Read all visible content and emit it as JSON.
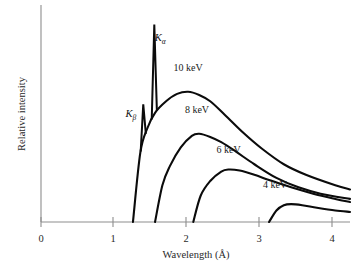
{
  "chart_data": {
    "type": "line",
    "title": "",
    "xlabel": "Wavelength (Å)",
    "ylabel": "Relative intensity",
    "xlim": [
      0,
      4.2
    ],
    "ylim": [
      0,
      1.0
    ],
    "grid": false,
    "legend": "inline-labels",
    "x_ticks": [
      "0",
      "1",
      "2",
      "3",
      "4"
    ],
    "x_tick_values": [
      0,
      1,
      2,
      3,
      4
    ],
    "y_ticks": [],
    "annotations": [
      {
        "text": "Kα",
        "base": "K",
        "sub": "α",
        "x": 1.62,
        "y": 0.86,
        "note": "characteristic K-alpha emission line"
      },
      {
        "text": "Kβ",
        "base": "K",
        "sub": "β",
        "x": 1.22,
        "y": 0.5,
        "note": "characteristic K-beta emission line"
      }
    ],
    "characteristic_lines": [
      {
        "name": "Kβ",
        "wavelength": 1.39,
        "height": 0.56
      },
      {
        "name": "Kα",
        "wavelength": 1.54,
        "height": 0.94
      }
    ],
    "series": [
      {
        "name": "10 keV",
        "label": "10 keV",
        "label_x": 2.0,
        "label_y": 0.72,
        "onset": 1.25,
        "peak_x": 2.0,
        "peak_y": 0.62,
        "x": [
          1.25,
          1.35,
          1.45,
          1.55,
          1.7,
          1.85,
          2.0,
          2.15,
          2.3,
          2.5,
          2.75,
          3.0,
          3.3,
          3.6,
          4.0,
          4.2
        ],
        "values": [
          0.0,
          0.33,
          0.45,
          0.52,
          0.575,
          0.61,
          0.62,
          0.605,
          0.575,
          0.51,
          0.425,
          0.35,
          0.275,
          0.225,
          0.175,
          0.155
        ]
      },
      {
        "name": "8 keV",
        "label": "8 keV",
        "label_x": 2.12,
        "label_y": 0.52,
        "onset": 1.55,
        "peak_x": 2.15,
        "peak_y": 0.42,
        "x": [
          1.55,
          1.65,
          1.75,
          1.9,
          2.05,
          2.15,
          2.3,
          2.45,
          2.65,
          2.9,
          3.2,
          3.5,
          3.8,
          4.2
        ],
        "values": [
          0.0,
          0.175,
          0.265,
          0.355,
          0.41,
          0.42,
          0.405,
          0.38,
          0.335,
          0.275,
          0.21,
          0.165,
          0.135,
          0.11
        ]
      },
      {
        "name": "6 keV",
        "label": "6 keV",
        "label_x": 2.55,
        "label_y": 0.33,
        "onset": 2.07,
        "peak_x": 2.55,
        "peak_y": 0.25,
        "x": [
          2.07,
          2.17,
          2.3,
          2.45,
          2.55,
          2.7,
          2.9,
          3.1,
          3.4,
          3.7,
          4.0,
          4.2
        ],
        "values": [
          0.0,
          0.125,
          0.195,
          0.24,
          0.25,
          0.245,
          0.225,
          0.2,
          0.165,
          0.135,
          0.11,
          0.095
        ]
      },
      {
        "name": "4 keV",
        "label": "4 keV",
        "label_x": 3.18,
        "label_y": 0.16,
        "onset": 3.1,
        "peak_x": 3.4,
        "peak_y": 0.085,
        "x": [
          3.1,
          3.2,
          3.3,
          3.4,
          3.55,
          3.75,
          4.0,
          4.2
        ],
        "values": [
          0.0,
          0.055,
          0.08,
          0.085,
          0.08,
          0.068,
          0.055,
          0.048
        ]
      }
    ]
  },
  "axes": {
    "x_title": "Wavelength (Å)",
    "y_title": "Relative intensity",
    "tick_0": "0",
    "tick_1": "1",
    "tick_2": "2",
    "tick_3": "3",
    "tick_4": "4"
  },
  "labels": {
    "s10": "10 keV",
    "s8": "8 keV",
    "s6": "6 keV",
    "s4": "4 keV",
    "k_alpha_base": "K",
    "k_alpha_sub": "α",
    "k_beta_base": "K",
    "k_beta_sub": "β"
  },
  "colors": {
    "background": "#ffffff",
    "curve": "#0b0b0b",
    "axis": "#8d8d8d",
    "text": "#1a1a1a"
  }
}
